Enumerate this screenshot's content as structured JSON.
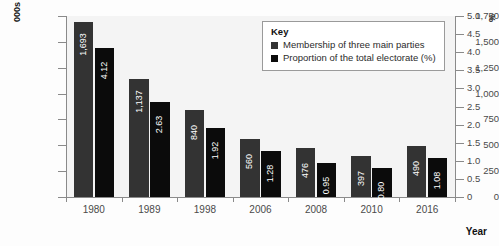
{
  "chart_data": {
    "type": "bar",
    "title": "",
    "subtitle": "",
    "xlabel": "Year",
    "categories": [
      "1980",
      "1989",
      "1998",
      "2006",
      "2008",
      "2010",
      "2016"
    ],
    "series": [
      {
        "name": "Membership of three main parties",
        "axis": "left",
        "unit": "000s",
        "color": "#333333",
        "values": [
          1693,
          1137,
          840,
          560,
          476,
          397,
          490
        ],
        "labels": [
          "1,693",
          "1,137",
          "840",
          "560",
          "476",
          "397",
          "490"
        ]
      },
      {
        "name": "Proportion of the total electorate (%)",
        "axis": "right",
        "unit": "%",
        "color": "#0b0b0b",
        "values": [
          4.12,
          2.63,
          1.92,
          1.28,
          0.95,
          0.8,
          1.08
        ],
        "labels": [
          "4.12",
          "2.63",
          "1.92",
          "1.28",
          "0.95",
          "0.80",
          "1.08"
        ]
      }
    ],
    "axis_left": {
      "label": "000s",
      "ylim": [
        0,
        1750
      ],
      "ticks": [
        0,
        250,
        500,
        750,
        1000,
        1250,
        1500,
        1750
      ],
      "tick_labels": [
        "0",
        "250",
        "500",
        "750",
        "1,000",
        "1,250",
        "1,500",
        "1,750"
      ]
    },
    "axis_right": {
      "label": "%",
      "ylim": [
        0,
        5.0
      ],
      "ticks": [
        0,
        0.5,
        1.0,
        1.5,
        2.0,
        2.5,
        3.0,
        3.5,
        4.0,
        4.5,
        5.0
      ],
      "tick_labels": [
        "0",
        "0.5",
        "1.0",
        "1.5",
        "2.0",
        "2.5",
        "3.0",
        "3.5",
        "4.0",
        "4.5",
        "5.0"
      ]
    },
    "grid": false,
    "legend_position": "top-right",
    "legend": {
      "title": "Key",
      "entries": [
        {
          "label": "Membership of three main parties",
          "color": "#333333"
        },
        {
          "label": "Proportion of the total electorate (%)",
          "color": "#0b0b0b"
        }
      ]
    }
  }
}
